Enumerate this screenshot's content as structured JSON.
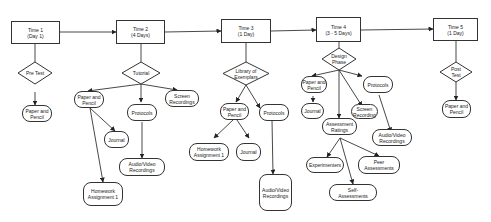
{
  "diagram": {
    "timeline": [
      {
        "id": "t1",
        "label": "Time 1\n(Day 1)"
      },
      {
        "id": "t2",
        "label": "Time 2\n(4 Days)"
      },
      {
        "id": "t3",
        "label": "Time 3\n(1 Day)"
      },
      {
        "id": "t4",
        "label": "Time 4\n(3 - 5 Days)"
      },
      {
        "id": "t5",
        "label": "Time 5\n(1 Day)"
      }
    ],
    "phases": [
      {
        "id": "d1",
        "label": "Pre Test"
      },
      {
        "id": "d2",
        "label": "Tutorial"
      },
      {
        "id": "d3",
        "label": "Library of\nExemplars"
      },
      {
        "id": "d4",
        "label": "Design\nPhase"
      },
      {
        "id": "d5",
        "label": "Post\nTest"
      }
    ],
    "nodes": {
      "t1_paper": "Paper and\nPencil",
      "t2_paper": "Paper and\nPencil",
      "t2_journal": "Journal",
      "t2_homework": "Homework\nAssignment 1",
      "t2_protocols": "Protocols",
      "t2_audio": "Audio/Video\nRecordings",
      "t2_screen": "Screen\nRecordings",
      "t3_paper": "Paper and\nPencil",
      "t3_homework": "Homework\nAssignment 1",
      "t3_journal": "Journal",
      "t3_protocols": "Protocols",
      "t3_audio": "Audio/Video\nRecordings",
      "t4_paper": "Paper and\nPencil",
      "t4_journal": "Journal",
      "t4_assessment": "Assessment\nRatings",
      "t4_screen": "Screen\nRecording",
      "t4_protocols": "Protocols",
      "t4_audio": "Audio/Video\nRecordings",
      "t4_experimenters": "Experimenters",
      "t4_peer": "Peer\nAssessments",
      "t4_self": "Self-\nAssessments",
      "t5_paper": "Paper and\nPencil"
    }
  }
}
